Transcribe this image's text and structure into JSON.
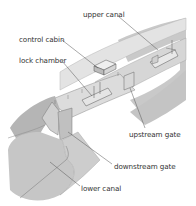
{
  "diagram": {
    "labels": {
      "upper_canal": "upper canal",
      "control_cabin": "control cabin",
      "lock_chamber": "lock chamber",
      "upstream_gate": "upstream gate",
      "downstream_gate": "downstream gate",
      "lower_canal": "lower canal"
    },
    "colors": {
      "background": "#ffffff",
      "water": "#c8c8c8",
      "bank": "#bdbdbd",
      "bank_dark": "#a8a8a8",
      "top_surface": "#e2e2e2",
      "leader_line": "#555555",
      "label_text": "#333333"
    }
  }
}
